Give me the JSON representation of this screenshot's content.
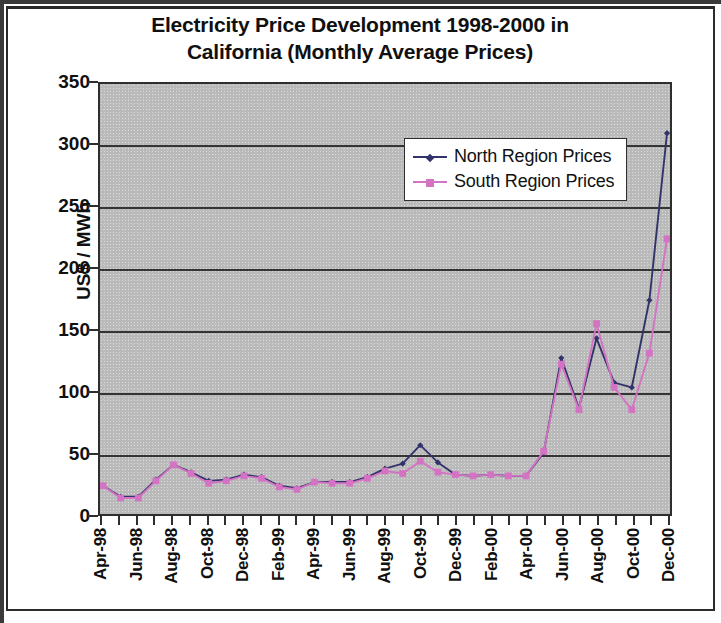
{
  "chart_data": {
    "type": "line",
    "title": "Electricity Price Development 1998-2000 in California (Monthly Average Prices)",
    "title_line1": "Electricity Price Development 1998-2000 in",
    "title_line2": "California (Monthly Average Prices)",
    "xlabel": "",
    "ylabel": "US$ / MWh",
    "ylim": [
      0,
      350
    ],
    "ytick_step": 50,
    "ytick_labels": [
      "350",
      "300",
      "250",
      "200",
      "150",
      "100",
      "50",
      "0"
    ],
    "ytick_values": [
      350,
      300,
      250,
      200,
      150,
      100,
      50,
      0
    ],
    "grid": true,
    "grid_axis": "y",
    "legend_position": "upper-center-right",
    "plot_background": "#b9b9b9",
    "x": [
      "Apr-98",
      "May-98",
      "Jun-98",
      "Jul-98",
      "Aug-98",
      "Sep-98",
      "Oct-98",
      "Nov-98",
      "Dec-98",
      "Jan-99",
      "Feb-99",
      "Mar-99",
      "Apr-99",
      "May-99",
      "Jun-99",
      "Jul-99",
      "Aug-99",
      "Sep-99",
      "Oct-99",
      "Nov-99",
      "Dec-99",
      "Jan-00",
      "Feb-00",
      "Mar-00",
      "Apr-00",
      "May-00",
      "Jun-00",
      "Jul-00",
      "Aug-00",
      "Sep-00",
      "Oct-00",
      "Nov-00",
      "Dec-00"
    ],
    "xtick_labels": [
      "Apr-98",
      "Jun-98",
      "Aug-98",
      "Oct-98",
      "Dec-98",
      "Feb-99",
      "Apr-99",
      "Jun-99",
      "Aug-99",
      "Oct-99",
      "Dec-99",
      "Feb-00",
      "Apr-00",
      "Jun-00",
      "Aug-00",
      "Oct-00",
      "Dec-00"
    ],
    "xtick_label_interval": 2,
    "series": [
      {
        "name": "North Region Prices",
        "color": "#33336b",
        "marker": "diamond",
        "values": [
          23,
          14,
          14,
          28,
          40,
          34,
          27,
          28,
          32,
          30,
          23,
          21,
          26,
          26,
          26,
          30,
          37,
          41,
          56,
          42,
          32,
          31,
          32,
          31,
          31,
          50,
          127,
          86,
          143,
          107,
          103,
          174,
          310
        ]
      },
      {
        "name": "South Region Prices",
        "color": "#d472c4",
        "marker": "square",
        "values": [
          23,
          13,
          13,
          27,
          40,
          33,
          25,
          27,
          31,
          29,
          22,
          20,
          26,
          25,
          25,
          29,
          35,
          33,
          43,
          34,
          32,
          31,
          32,
          31,
          31,
          51,
          122,
          85,
          155,
          103,
          85,
          131,
          224
        ]
      }
    ]
  },
  "legend": {
    "items": [
      {
        "label": "North Region Prices",
        "color": "#33336b",
        "marker": "diamond"
      },
      {
        "label": "South Region Prices",
        "color": "#d472c4",
        "marker": "square"
      }
    ]
  }
}
